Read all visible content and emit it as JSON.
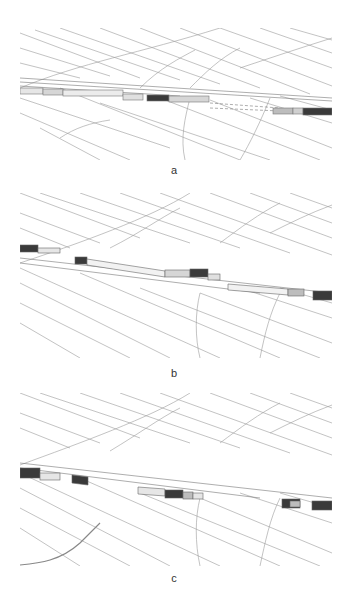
{
  "figure": {
    "panels": [
      {
        "id": "a",
        "label": "a",
        "description": "3D parcel map with continuous row of building blocks along route, dashed segment gap"
      },
      {
        "id": "b",
        "label": "b",
        "description": "3D parcel map with elongated building blocks separated into segments"
      },
      {
        "id": "c",
        "label": "c",
        "description": "3D parcel map with small isolated building blocks"
      }
    ],
    "colors": {
      "line": "#9a9a9a",
      "block_light": "#e6e6e6",
      "block_mid": "#bdbdbd",
      "block_dark": "#3a3a3a",
      "background": "#ffffff"
    }
  }
}
